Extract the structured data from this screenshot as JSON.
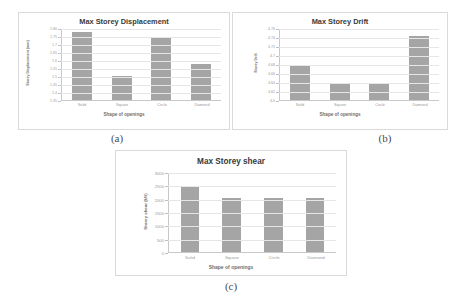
{
  "figure": {
    "captions": [
      {
        "id": "a",
        "text": "(a)"
      },
      {
        "id": "b",
        "text": "(b)"
      },
      {
        "id": "c",
        "text": "(c)"
      }
    ]
  },
  "chart_data": [
    {
      "type": "bar",
      "panel": "a",
      "title": "Max Storey Displacement",
      "categories": [
        "Solid",
        "Square",
        "Circle",
        "Diamond"
      ],
      "values": [
        1.78,
        1.5,
        1.74,
        1.58
      ],
      "xlabel": "Shape of openings",
      "ylabel": "Storey Displacement (mm)",
      "ylim": [
        1.35,
        1.8
      ],
      "yticks": [
        1.8,
        1.75,
        1.7,
        1.65,
        1.6,
        1.55,
        1.5,
        1.45,
        1.4,
        1.35
      ],
      "ytick_labels": [
        "1.80",
        "1.75",
        "1.7",
        "1.65",
        "1.6",
        "1.55",
        "1.5",
        "1.45",
        "1.4",
        "1.35"
      ],
      "grid": true,
      "legend": "none",
      "bar_color": "#a5a5a5"
    },
    {
      "type": "bar",
      "panel": "b",
      "title": "Max Storey Drift",
      "categories": [
        "Solid",
        "Square",
        "Circle",
        "Diamond"
      ],
      "values": [
        4.68,
        4.635,
        4.635,
        4.745
      ],
      "xlabel": "Shape of openings",
      "ylabel": "Storey Drift",
      "ylim": [
        4.6,
        4.76
      ],
      "yticks": [
        4.76,
        4.74,
        4.72,
        4.7,
        4.68,
        4.66,
        4.64,
        4.62,
        4.6
      ],
      "ytick_labels": [
        "4.76",
        "4.74",
        "4.72",
        "4.7",
        "4.68",
        "4.66",
        "4.64",
        "4.62",
        "4.6"
      ],
      "grid": true,
      "legend": "none",
      "bar_color": "#a5a5a5"
    },
    {
      "type": "bar",
      "panel": "c",
      "title": "Max Storey shear",
      "categories": [
        "Solid",
        "Square",
        "Circle",
        "Diamond"
      ],
      "values": [
        2450,
        2050,
        2050,
        2050
      ],
      "xlabel": "Shape of openings",
      "ylabel": "Storey shear (kN)",
      "ylim": [
        0,
        3000
      ],
      "yticks": [
        3000,
        2500,
        2000,
        1500,
        1000,
        500,
        0
      ],
      "ytick_labels": [
        "3000",
        "2500",
        "2000",
        "1500",
        "1000",
        "500",
        "0"
      ],
      "grid": true,
      "legend": "none",
      "bar_color": "#a5a5a5"
    }
  ]
}
